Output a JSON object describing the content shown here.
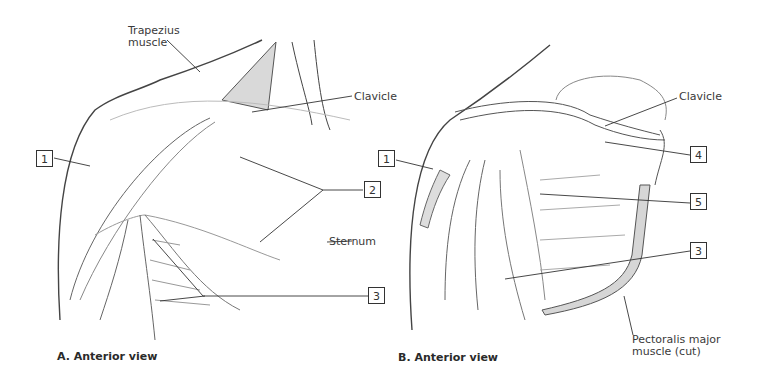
{
  "panels": [
    {
      "caption": "A. Anterior view",
      "labels": {
        "trapezius": "Trapezius\nmuscle",
        "clavicle": "Clavicle",
        "sternum": "Sternum"
      },
      "numbered": [
        "1",
        "2",
        "3"
      ]
    },
    {
      "caption": "B. Anterior view",
      "labels": {
        "clavicle": "Clavicle",
        "pectoralis": "Pectoralis major\nmuscle (cut)"
      },
      "numbered": [
        "1",
        "4",
        "5",
        "3"
      ]
    }
  ],
  "colors": {
    "line": "#333333",
    "shade": "#cfcfcf",
    "muscle_cut": "#d8d8d8"
  }
}
